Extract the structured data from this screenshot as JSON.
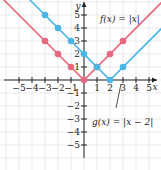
{
  "chart_data": {
    "type": "line",
    "title": "",
    "xlabel": "x",
    "ylabel": "y",
    "xlim": [
      -6,
      6
    ],
    "ylim": [
      -6,
      6
    ],
    "grid": true,
    "x_ticks": [
      -5,
      -4,
      -3,
      -2,
      -1,
      1,
      2,
      3,
      4,
      5
    ],
    "y_ticks": [
      5,
      4,
      3,
      2,
      1,
      -1,
      -2,
      -3,
      -4,
      -5
    ],
    "x_tick_labels": [
      "−5",
      "−4",
      "−3",
      "−2",
      "−1",
      "1",
      "2",
      "3",
      "4",
      "5"
    ],
    "y_tick_labels": [
      "5",
      "4",
      "3",
      "2",
      "1",
      "−1",
      "−2",
      "−3",
      "−4",
      "−5"
    ],
    "series": [
      {
        "name": "f(x) = |x|",
        "label": "f(x) = |x|",
        "color": "#e8697f",
        "points": [
          [
            -3,
            3
          ],
          [
            -2,
            2
          ],
          [
            -1,
            1
          ],
          [
            0,
            0
          ],
          [
            1,
            1
          ],
          [
            2,
            2
          ],
          [
            3,
            3
          ]
        ]
      },
      {
        "name": "g(x) = |x − 2|",
        "label": "g(x) = |x − 2|",
        "color": "#4bb6e6",
        "points": [
          [
            -3,
            5
          ],
          [
            -2,
            4
          ],
          [
            -1,
            3
          ],
          [
            0,
            2
          ],
          [
            1,
            1
          ],
          [
            2,
            0
          ],
          [
            3,
            1
          ]
        ]
      }
    ]
  }
}
